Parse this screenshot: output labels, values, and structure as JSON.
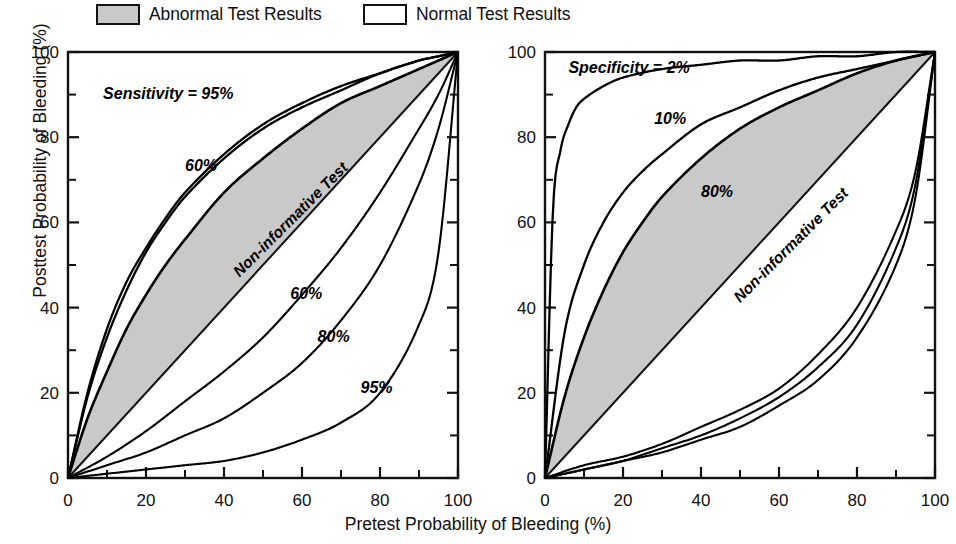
{
  "legend": {
    "items": [
      {
        "label": "Abnormal Test Results",
        "swatch": "shaded",
        "x": 96
      },
      {
        "label": "Normal Test Results",
        "swatch": "plain",
        "x": 363
      }
    ]
  },
  "axes": {
    "xlabel": "Pretest Probability of Bleeding (%)",
    "ylabel": "Posttest Probability of Bleeding (%)",
    "xticks": [
      "0",
      "20",
      "40",
      "60",
      "80",
      "100"
    ],
    "yticks": [
      "0",
      "20",
      "40",
      "60",
      "80",
      "100"
    ],
    "xlim": [
      0,
      100
    ],
    "ylim": [
      0,
      100
    ],
    "minor_ticks": [
      10,
      30,
      50,
      70,
      90
    ]
  },
  "chart_data": [
    {
      "type": "line",
      "panel": "left",
      "title": "",
      "xlabel": "Pretest Probability of Bleeding (%)",
      "ylabel": "Posttest Probability of Bleeding (%)",
      "xlim": [
        0,
        100
      ],
      "ylim": [
        0,
        100
      ],
      "grid": false,
      "legend_position": "top",
      "annotations": [
        {
          "text": "Sensitivity = 95%",
          "x": 9,
          "y": 89,
          "rotation": 0,
          "italic": true
        },
        {
          "text": "60%",
          "x": 30,
          "y": 72,
          "rotation": 0,
          "italic": true
        },
        {
          "text": "Non-informative Test",
          "x": 44,
          "y": 47,
          "rotation": -45,
          "italic": true
        },
        {
          "text": "60%",
          "x": 57,
          "y": 42,
          "rotation": 0,
          "italic": true
        },
        {
          "text": "80%",
          "x": 64,
          "y": 32,
          "rotation": 0,
          "italic": true
        },
        {
          "text": "95%",
          "x": 75,
          "y": 20,
          "rotation": 0,
          "italic": true
        }
      ],
      "series": [
        {
          "name": "Non-informative Test",
          "kind": "diagonal",
          "x": [
            0,
            100
          ],
          "values": [
            0,
            100
          ]
        },
        {
          "name": "Abnormal, Sensitivity = 95%",
          "kind": "ppv",
          "sens": 0.95,
          "spec": 0.8,
          "x": [
            0,
            5,
            10,
            15,
            20,
            25,
            30,
            40,
            50,
            60,
            70,
            80,
            90,
            95,
            100
          ],
          "values": [
            0,
            20,
            35,
            46,
            54,
            61,
            67,
            76,
            83,
            88,
            92,
            95,
            98,
            99,
            100
          ]
        },
        {
          "name": "Abnormal, Sensitivity = 90%",
          "kind": "ppv",
          "sens": 0.9,
          "spec": 0.8,
          "x": [
            0,
            5,
            10,
            15,
            20,
            25,
            30,
            40,
            50,
            60,
            70,
            80,
            90,
            95,
            100
          ],
          "values": [
            0,
            19,
            33,
            44,
            53,
            60,
            66,
            75,
            82,
            87,
            91,
            95,
            98,
            99,
            100
          ]
        },
        {
          "name": "Abnormal, Sensitivity = 60%",
          "kind": "ppv",
          "sens": 0.6,
          "spec": 0.8,
          "x": [
            0,
            5,
            10,
            15,
            20,
            25,
            30,
            40,
            50,
            60,
            70,
            80,
            90,
            95,
            100
          ],
          "values": [
            0,
            14,
            25,
            35,
            43,
            50,
            56,
            67,
            75,
            82,
            88,
            92,
            96,
            98,
            100
          ]
        },
        {
          "name": "Normal, Sensitivity = 60%",
          "kind": "npv",
          "sens": 0.6,
          "spec": 0.8,
          "x": [
            0,
            10,
            20,
            30,
            40,
            50,
            60,
            70,
            80,
            90,
            95,
            100
          ],
          "values": [
            0,
            5,
            11,
            18,
            25,
            33,
            43,
            54,
            67,
            82,
            90,
            100
          ]
        },
        {
          "name": "Normal, Sensitivity = 80%",
          "kind": "npv",
          "sens": 0.8,
          "spec": 0.8,
          "x": [
            0,
            10,
            20,
            30,
            40,
            50,
            60,
            70,
            80,
            90,
            95,
            100
          ],
          "values": [
            0,
            3,
            6,
            10,
            14,
            20,
            27,
            37,
            50,
            69,
            82,
            100
          ]
        },
        {
          "name": "Normal, Sensitivity = 95%",
          "kind": "npv",
          "sens": 0.95,
          "spec": 0.8,
          "x": [
            0,
            10,
            20,
            30,
            40,
            50,
            60,
            70,
            80,
            90,
            95,
            100
          ],
          "values": [
            0,
            1,
            2,
            3,
            4,
            6,
            9,
            13,
            20,
            36,
            53,
            100
          ]
        }
      ]
    },
    {
      "type": "line",
      "panel": "right",
      "title": "",
      "xlabel": "Pretest Probability of Bleeding (%)",
      "ylabel": "Posttest Probability of Bleeding (%)",
      "xlim": [
        0,
        100
      ],
      "ylim": [
        0,
        100
      ],
      "grid": false,
      "legend_position": "top",
      "annotations": [
        {
          "text": "Specificity = 2%",
          "x": 6,
          "y": 95,
          "rotation": 0,
          "italic": true
        },
        {
          "text": "10%",
          "x": 28,
          "y": 83,
          "rotation": 0,
          "italic": true
        },
        {
          "text": "80%",
          "x": 40,
          "y": 66,
          "rotation": 0,
          "italic": true
        },
        {
          "text": "Non-informative Test",
          "x": 50,
          "y": 41,
          "rotation": -45,
          "italic": true
        }
      ],
      "series": [
        {
          "name": "Non-informative Test",
          "kind": "diagonal",
          "x": [
            0,
            100
          ],
          "values": [
            0,
            100
          ]
        },
        {
          "name": "Abnormal, Specificity = 2%",
          "kind": "ppv_spec",
          "sens": 0.9,
          "spec": 0.02,
          "x": [
            0,
            2,
            4,
            6,
            8,
            10,
            15,
            20,
            30,
            40,
            50,
            60,
            70,
            80,
            90,
            100
          ],
          "values": [
            0,
            62,
            77,
            83,
            87,
            89,
            92,
            94,
            96,
            97,
            98,
            98,
            99,
            99,
            100,
            100
          ]
        },
        {
          "name": "Abnormal, Specificity = 10%",
          "kind": "ppv_spec",
          "sens": 0.9,
          "spec": 0.1,
          "x": [
            0,
            5,
            10,
            15,
            20,
            25,
            30,
            40,
            50,
            60,
            70,
            80,
            90,
            100
          ],
          "values": [
            0,
            34,
            50,
            60,
            67,
            72,
            76,
            83,
            87,
            91,
            94,
            96,
            98,
            100
          ]
        },
        {
          "name": "Abnormal, Specificity = 80%",
          "kind": "ppv_spec",
          "sens": 0.9,
          "spec": 0.8,
          "x": [
            0,
            5,
            10,
            15,
            20,
            25,
            30,
            40,
            50,
            60,
            70,
            80,
            90,
            100
          ],
          "values": [
            0,
            19,
            33,
            44,
            53,
            60,
            66,
            75,
            82,
            87,
            91,
            95,
            98,
            100
          ]
        },
        {
          "name": "Normal a",
          "kind": "npv_spec",
          "sens": 0.9,
          "spec": 0.8,
          "x": [
            0,
            10,
            20,
            30,
            40,
            50,
            60,
            70,
            80,
            90,
            95,
            100
          ],
          "values": [
            0,
            2,
            4,
            6,
            9,
            12,
            17,
            23,
            33,
            50,
            66,
            100
          ]
        },
        {
          "name": "Normal b",
          "kind": "npv_spec",
          "sens": 0.9,
          "spec": 0.6,
          "x": [
            0,
            10,
            20,
            30,
            40,
            50,
            60,
            70,
            80,
            90,
            95,
            100
          ],
          "values": [
            0,
            2,
            4,
            7,
            10,
            14,
            19,
            26,
            36,
            54,
            69,
            100
          ]
        },
        {
          "name": "Normal c",
          "kind": "npv_spec",
          "sens": 0.9,
          "spec": 0.4,
          "x": [
            0,
            10,
            20,
            30,
            40,
            50,
            60,
            70,
            80,
            90,
            95,
            100
          ],
          "values": [
            0,
            3,
            5,
            8,
            12,
            16,
            21,
            29,
            40,
            58,
            72,
            100
          ]
        }
      ]
    }
  ]
}
